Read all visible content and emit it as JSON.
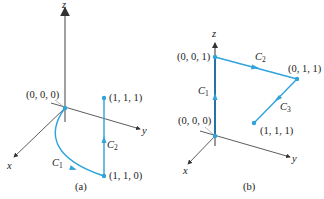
{
  "colors": {
    "curve": "#2ea3dc",
    "axis": "#333333",
    "zaxis_a": "#888888",
    "zaxis_b": "#1a6ea8"
  },
  "panel_a": {
    "caption": "(a)",
    "axes": {
      "x": "x",
      "y": "y",
      "z": "z"
    },
    "points": [
      {
        "label": "(0, 0, 0)"
      },
      {
        "label": "(1, 1, 1)"
      },
      {
        "label": "(1, 1, 0)"
      }
    ],
    "curves": [
      {
        "name": "C",
        "sub": "1",
        "from": "(0, 0, 0)",
        "to": "(1, 1, 0)"
      },
      {
        "name": "C",
        "sub": "2",
        "from": "(1, 1, 0)",
        "to": "(1, 1, 1)"
      }
    ]
  },
  "panel_b": {
    "caption": "(b)",
    "axes": {
      "x": "x",
      "y": "y",
      "z": "z"
    },
    "points": [
      {
        "label": "(0, 0, 0)"
      },
      {
        "label": "(0, 0, 1)"
      },
      {
        "label": "(0, 1, 1)"
      },
      {
        "label": "(1, 1, 1)"
      }
    ],
    "curves": [
      {
        "name": "C",
        "sub": "1",
        "from": "(0, 0, 0)",
        "to": "(0, 0, 1)"
      },
      {
        "name": "C",
        "sub": "2",
        "from": "(0, 0, 1)",
        "to": "(0, 1, 1)"
      },
      {
        "name": "C",
        "sub": "3",
        "from": "(0, 1, 1)",
        "to": "(1, 1, 1)"
      }
    ]
  }
}
